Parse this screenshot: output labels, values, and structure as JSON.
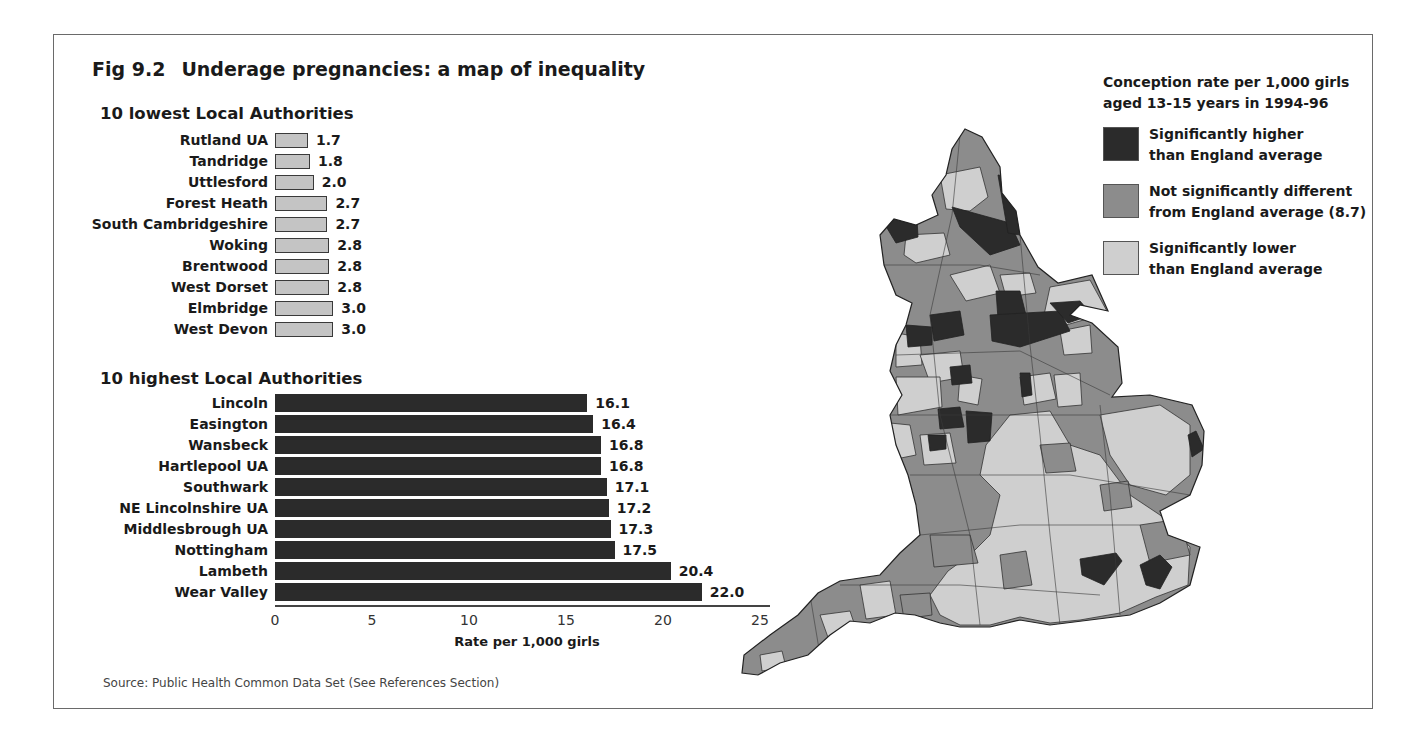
{
  "figure": {
    "number": "Fig 9.2",
    "title": "Underage pregnancies:  a map of inequality",
    "source": "Source: Public Health Common Data Set (See References Section)"
  },
  "legend": {
    "title_line1": "Conception rate per 1,000 girls",
    "title_line2": "aged 13-15 years in 1994-96",
    "items": [
      {
        "line1": "Significantly higher",
        "line2": "than England average",
        "color": "#2b2b2b"
      },
      {
        "line1": "Not significantly different",
        "line2": "from England average (8.7)",
        "color": "#8c8c8c"
      },
      {
        "line1": "Significantly lower",
        "line2": "than England average",
        "color": "#cfcfcf"
      }
    ]
  },
  "chart_data": [
    {
      "type": "bar",
      "orientation": "horizontal",
      "title": "10 lowest Local Authorities",
      "categories": [
        "Rutland UA",
        "Tandridge",
        "Uttlesford",
        "Forest Heath",
        "South Cambridgeshire",
        "Woking",
        "Brentwood",
        "West Dorset",
        "Elmbridge",
        "West Devon"
      ],
      "values": [
        1.7,
        1.8,
        2.0,
        2.7,
        2.7,
        2.8,
        2.8,
        2.8,
        3.0,
        3.0
      ],
      "value_labels": [
        "1.7",
        "1.8",
        "2.0",
        "2.7",
        "2.7",
        "2.8",
        "2.8",
        "2.8",
        "3.0",
        "3.0"
      ],
      "color": "#c4c4c4"
    },
    {
      "type": "bar",
      "orientation": "horizontal",
      "title": "10 highest Local Authorities",
      "categories": [
        "Lincoln",
        "Easington",
        "Wansbeck",
        "Hartlepool UA",
        "Southwark",
        "NE Lincolnshire UA",
        "Middlesbrough UA",
        "Nottingham",
        "Lambeth",
        "Wear Valley"
      ],
      "values": [
        16.1,
        16.4,
        16.8,
        16.8,
        17.1,
        17.2,
        17.3,
        17.5,
        20.4,
        22.0
      ],
      "value_labels": [
        "16.1",
        "16.4",
        "16.8",
        "16.8",
        "17.1",
        "17.2",
        "17.3",
        "17.5",
        "20.4",
        "22.0"
      ],
      "color": "#2b2b2b",
      "xlabel": "Rate per 1,000 girls",
      "xlim": [
        0,
        25
      ],
      "xticks": [
        "0",
        "5",
        "10",
        "15",
        "20",
        "25"
      ],
      "grid": false
    },
    {
      "type": "choropleth-map",
      "title": "Conception rate per 1,000 girls aged 13-15 years in 1994-96",
      "region": "England (Local Authorities)",
      "categories": [
        "Significantly higher than England average",
        "Not significantly different from England average (8.7)",
        "Significantly lower than England average"
      ],
      "england_average": 8.7
    }
  ]
}
